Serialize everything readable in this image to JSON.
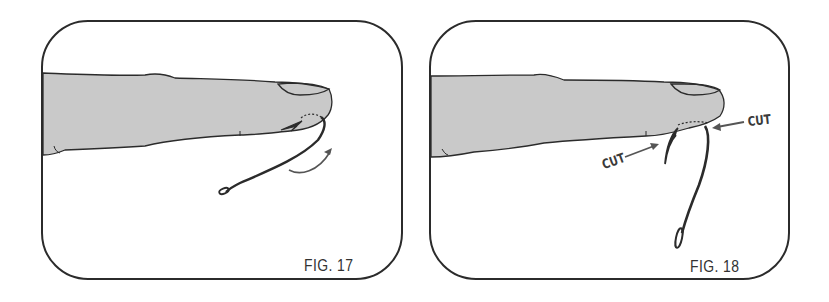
{
  "figures": [
    {
      "id": "fig17",
      "label": "FIG. 17",
      "description": "Fishhook embedded in fingertip; shank pushed in direction of curved arrow so the barb exits the skin",
      "elements": [
        "finger",
        "fingernail",
        "embedded-hook",
        "barb",
        "rotation-arrow"
      ]
    },
    {
      "id": "fig18",
      "label": "FIG. 18",
      "description": "Barb pushed through skin; hook cut at two points marked CUT",
      "elements": [
        "finger",
        "fingernail",
        "hook-shank",
        "barbed-point",
        "cut-arrow-left",
        "cut-arrow-right"
      ],
      "annotations": [
        {
          "text": "CUT",
          "position": "left, below finger pointing to barbed point"
        },
        {
          "text": "CUT",
          "position": "right, pointing to shank at skin entry"
        }
      ]
    }
  ],
  "colors": {
    "outline": "#2b2b2b",
    "finger_fill": "#c9c9c9",
    "arrow": "#555555",
    "background": "#ffffff"
  }
}
